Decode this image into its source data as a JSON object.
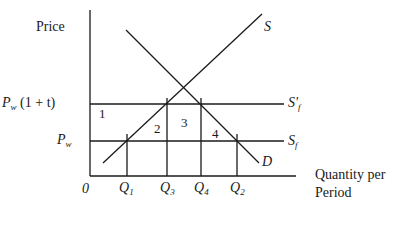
{
  "diagram": {
    "y_axis_label": "Price",
    "x_axis_label_line1": "Quantity per",
    "x_axis_label_line2": "Period",
    "origin_label": "0",
    "price_levels": [
      {
        "symbol": "P",
        "subscript": "w",
        "suffix": "(1 + t)",
        "line_label": "S'",
        "line_label_sub": "f"
      },
      {
        "symbol": "P",
        "subscript": "w",
        "suffix": "",
        "line_label": "S",
        "line_label_sub": "f"
      }
    ],
    "curves": {
      "supply": "S",
      "demand": "D"
    },
    "quantities": [
      {
        "symbol": "Q",
        "subscript": "1"
      },
      {
        "symbol": "Q",
        "subscript": "3"
      },
      {
        "symbol": "Q",
        "subscript": "4"
      },
      {
        "symbol": "Q",
        "subscript": "2"
      }
    ],
    "regions": [
      "1",
      "2",
      "3",
      "4"
    ],
    "colors": {
      "line": "#1a1a1a",
      "background": "#ffffff"
    }
  }
}
